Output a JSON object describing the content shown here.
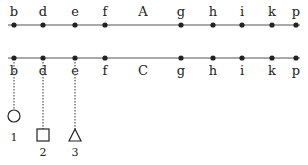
{
  "diagram": {
    "line_a": {
      "name": "A",
      "y": 25,
      "label_y": 16,
      "points": [
        {
          "label": "b",
          "x": 14
        },
        {
          "label": "d",
          "x": 43
        },
        {
          "label": "e",
          "x": 75
        },
        {
          "label": "f",
          "x": 105
        },
        {
          "label": "g",
          "x": 181
        },
        {
          "label": "h",
          "x": 213
        },
        {
          "label": "i",
          "x": 242
        },
        {
          "label": "k",
          "x": 272
        },
        {
          "label": "p",
          "x": 296
        }
      ],
      "name_x": 143
    },
    "line_c": {
      "name": "C",
      "y": 58,
      "label_y": 75,
      "points": [
        {
          "label": "b",
          "x": 14
        },
        {
          "label": "d",
          "x": 43
        },
        {
          "label": "e",
          "x": 75
        },
        {
          "label": "f",
          "x": 105
        },
        {
          "label": "g",
          "x": 181
        },
        {
          "label": "h",
          "x": 213
        },
        {
          "label": "i",
          "x": 242
        },
        {
          "label": "k",
          "x": 272
        },
        {
          "label": "p",
          "x": 296
        }
      ],
      "name_x": 143
    },
    "markers": [
      {
        "shape": "circle",
        "label": "1",
        "x": 14,
        "from": "b"
      },
      {
        "shape": "square",
        "label": "2",
        "x": 43,
        "from": "d"
      },
      {
        "shape": "triangle",
        "label": "3",
        "x": 75,
        "from": "e"
      }
    ],
    "colors": {
      "ink": "#222222",
      "line": "#555555"
    }
  }
}
